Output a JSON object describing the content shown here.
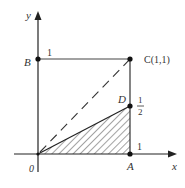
{
  "diagram": {
    "axes": {
      "x_label": "x",
      "y_label": "y",
      "origin_label": "0"
    },
    "points": {
      "B": {
        "label": "B",
        "tick_label": "1"
      },
      "C": {
        "label": "C(1,1)"
      },
      "D": {
        "label": "D",
        "value_numerator": "1",
        "value_denominator": "2"
      },
      "A": {
        "label": "A",
        "tick_label": "1"
      }
    },
    "shaded_region": "triangle O-A-D (hatched)",
    "dashed_line": "O to C diagonal",
    "colors": {
      "line": "#222222",
      "hatch": "#555555",
      "text": "#333333"
    }
  }
}
